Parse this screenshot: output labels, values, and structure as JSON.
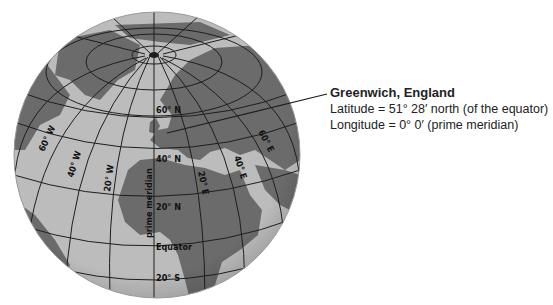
{
  "figure": {
    "type": "globe-latitude-longitude-diagram",
    "colors": {
      "ocean": "#bcbcbc",
      "land": "#6b6b6b",
      "grid": "#1e1e1e",
      "text": "#222222",
      "background": "#ffffff"
    }
  },
  "annotation": {
    "title": "Greenwich, England",
    "latitude": "Latitude = 51° 28′ north (of the equator)",
    "longitude": "Longitude = 0° 0′ (prime meridian)"
  },
  "globe_labels": {
    "lat_60n": "60° N",
    "lat_40n": "40° N",
    "lat_20n": "20° N",
    "equator": "Equator",
    "lat_20s": "20° S",
    "lon_60w": "60° W",
    "lon_40w": "40° W",
    "lon_20w": "20° W",
    "prime_meridian": "prime meridian",
    "lon_20e": "20° E",
    "lon_40e": "40° E",
    "lon_60e": "60° E"
  }
}
